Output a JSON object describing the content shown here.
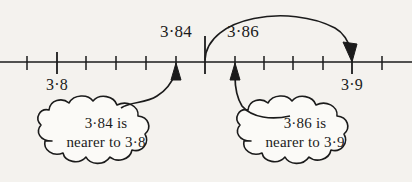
{
  "figure": {
    "type": "number-line-diagram",
    "caption_partial_top": "",
    "ink_color": "#1b1b1b",
    "paper_color": "#f4f2ee"
  },
  "number_line": {
    "axis_y": 62,
    "x_start": 0,
    "x_end": 412,
    "major_ticks": [
      {
        "x": 57,
        "label": "3·8",
        "label_y": 88
      },
      {
        "x": 205,
        "label": "",
        "label_y": 88
      },
      {
        "x": 352,
        "label": "3·9",
        "label_y": 88
      }
    ],
    "minor_ticks": [
      {
        "x": 27
      },
      {
        "x": 86
      },
      {
        "x": 116
      },
      {
        "x": 146
      },
      {
        "x": 176
      },
      {
        "x": 235
      },
      {
        "x": 264
      },
      {
        "x": 293
      },
      {
        "x": 323
      },
      {
        "x": 382
      }
    ]
  },
  "value_labels": [
    {
      "text": "3·84",
      "x": 176,
      "y": 30
    },
    {
      "text": "3·86",
      "x": 243,
      "y": 30
    }
  ],
  "rounding_arc": {
    "from_x": 205,
    "to_x": 352,
    "peak_y": 10,
    "description": "arc-arrow-3-86-rounds-to-3-9"
  },
  "callouts": [
    {
      "name": "left",
      "line1": "3·84 is",
      "line2": "nearer to 3·8",
      "center_x": 106,
      "center_y": 143,
      "points_to_x": 176
    },
    {
      "name": "right",
      "line1": "3·86 is",
      "line2": "nearer to 3·9",
      "center_x": 305,
      "center_y": 143,
      "points_to_x": 235
    }
  ]
}
